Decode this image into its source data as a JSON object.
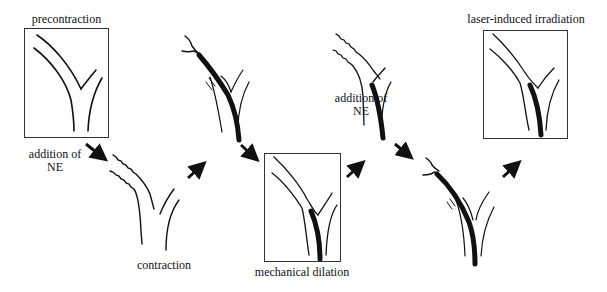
{
  "diagram": {
    "stages": [
      {
        "id": "precontraction",
        "label": "precontraction",
        "boxed": true,
        "vessel_state": "relaxed"
      },
      {
        "id": "contraction",
        "label": "contraction",
        "boxed": false,
        "vessel_state": "constricted"
      },
      {
        "id": "inflated-balloon",
        "label": "",
        "boxed": false,
        "vessel_state": "balloon-inside-constricted"
      },
      {
        "id": "mechanical-dilation",
        "label": "mechanical dilation",
        "boxed": true,
        "vessel_state": "dilated-with-catheter"
      },
      {
        "id": "re-contraction",
        "label": "",
        "boxed": false,
        "vessel_state": "constricted-with-catheter"
      },
      {
        "id": "laser-balloon",
        "label": "",
        "boxed": false,
        "vessel_state": "balloon-inside-constricted"
      },
      {
        "id": "laser-induced-irradiation",
        "label": "laser-induced irradiation",
        "boxed": true,
        "vessel_state": "dilated-with-catheter"
      }
    ],
    "annotations": [
      {
        "id": "addition-ne-1",
        "line1": "addition of",
        "line2": "NE"
      },
      {
        "id": "addition-ne-2",
        "line1": "addition of",
        "line2": "NE"
      }
    ],
    "arrows": [
      {
        "from": "precontraction",
        "to": "contraction",
        "direction": "down-right"
      },
      {
        "from": "contraction",
        "to": "inflated-balloon",
        "direction": "up-right"
      },
      {
        "from": "inflated-balloon",
        "to": "mechanical-dilation",
        "direction": "down-right"
      },
      {
        "from": "mechanical-dilation",
        "to": "re-contraction",
        "direction": "up-right"
      },
      {
        "from": "re-contraction",
        "to": "laser-balloon",
        "direction": "down-right"
      },
      {
        "from": "laser-balloon",
        "to": "laser-induced-irradiation",
        "direction": "up-right"
      }
    ],
    "colors": {
      "ink": "#111111",
      "background": "#ffffff",
      "frame": "#333333"
    }
  }
}
